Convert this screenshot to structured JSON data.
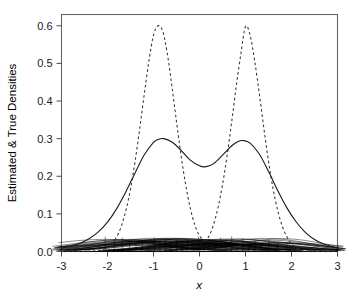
{
  "chart_data": {
    "type": "line",
    "title": "",
    "xlabel": "x",
    "ylabel": "Estimated & True Densities",
    "xlim": [
      -3,
      3
    ],
    "ylim": [
      0,
      0.63
    ],
    "grid": false,
    "legend": "none",
    "xticks": [
      "-3",
      "-2",
      "-1",
      "0",
      "1",
      "2",
      "3"
    ],
    "xtick_values": [
      -3,
      -2,
      -1,
      0,
      1,
      2,
      3
    ],
    "yticks": [
      "0.0",
      "0.1",
      "0.2",
      "0.3",
      "0.4",
      "0.5",
      "0.6"
    ],
    "ytick_values": [
      0.0,
      0.1,
      0.2,
      0.3,
      0.4,
      0.5,
      0.6
    ],
    "series": [
      {
        "name": "true density",
        "style": "dashed",
        "color": "#333333",
        "description": "Two narrow normal components centred at -1 and 1, each peaking near 0.60",
        "peaks": [
          {
            "x": -1.0,
            "y": 0.6
          },
          {
            "x": 1.0,
            "y": 0.6
          }
        ],
        "x": [
          -3.0,
          -2.8,
          -2.6,
          -2.4,
          -2.2,
          -2.0,
          -1.9,
          -1.8,
          -1.7,
          -1.6,
          -1.5,
          -1.4,
          -1.3,
          -1.2,
          -1.1,
          -1.0,
          -0.9,
          -0.8,
          -0.7,
          -0.6,
          -0.5,
          -0.4,
          -0.3,
          -0.2,
          -0.1,
          0.0,
          0.1,
          0.2,
          0.3,
          0.4,
          0.5,
          0.6,
          0.7,
          0.8,
          0.9,
          1.0,
          1.1,
          1.2,
          1.3,
          1.4,
          1.5,
          1.6,
          1.7,
          1.8,
          1.9,
          2.0,
          2.2,
          2.4,
          2.6,
          2.8,
          3.0
        ],
        "y": [
          0.0,
          0.0,
          0.0,
          0.001,
          0.003,
          0.011,
          0.021,
          0.039,
          0.067,
          0.109,
          0.166,
          0.24,
          0.327,
          0.419,
          0.506,
          0.575,
          0.6,
          0.586,
          0.526,
          0.44,
          0.345,
          0.255,
          0.177,
          0.115,
          0.07,
          0.042,
          0.03,
          0.039,
          0.07,
          0.115,
          0.177,
          0.255,
          0.345,
          0.44,
          0.526,
          0.598,
          0.575,
          0.506,
          0.419,
          0.327,
          0.24,
          0.166,
          0.109,
          0.067,
          0.039,
          0.021,
          0.003,
          0.001,
          0.0,
          0.0,
          0.0
        ]
      },
      {
        "name": "estimated density",
        "style": "solid",
        "color": "#1a1a1a",
        "description": "Oversmoothed kernel density estimate, bimodal with peaks near 0.30 and a valley near 0.225",
        "peaks": [
          {
            "x": -0.78,
            "y": 0.3
          },
          {
            "x": 0.95,
            "y": 0.295
          }
        ],
        "valley": {
          "x": 0.12,
          "y": 0.225
        },
        "x": [
          -3.0,
          -2.8,
          -2.6,
          -2.4,
          -2.2,
          -2.0,
          -1.8,
          -1.6,
          -1.4,
          -1.2,
          -1.0,
          -0.9,
          -0.78,
          -0.6,
          -0.4,
          -0.2,
          0.0,
          0.12,
          0.3,
          0.5,
          0.7,
          0.85,
          0.95,
          1.1,
          1.3,
          1.5,
          1.7,
          1.9,
          2.1,
          2.3,
          2.5,
          2.7,
          3.0
        ],
        "y": [
          0.009,
          0.014,
          0.022,
          0.034,
          0.052,
          0.078,
          0.114,
          0.159,
          0.209,
          0.257,
          0.29,
          0.298,
          0.3,
          0.291,
          0.269,
          0.243,
          0.228,
          0.225,
          0.233,
          0.256,
          0.281,
          0.293,
          0.295,
          0.288,
          0.259,
          0.213,
          0.162,
          0.116,
          0.079,
          0.051,
          0.032,
          0.02,
          0.009
        ]
      },
      {
        "name": "individual kernel components",
        "style": "solid-thin",
        "color": "#000000",
        "description": "Dense overlapping bundle of individual scaled kernels near the baseline, each peaking around 0.03, centred between about -2 and 2",
        "component_peak_height": 0.03,
        "component_count": 60,
        "centers": [
          -2.05,
          -1.92,
          -1.85,
          -1.74,
          -1.68,
          -1.6,
          -1.52,
          -1.45,
          -1.38,
          -1.3,
          -1.24,
          -1.17,
          -1.1,
          -1.04,
          -0.98,
          -0.92,
          -0.86,
          -0.8,
          -0.74,
          -0.68,
          -0.62,
          -0.56,
          -0.5,
          -0.44,
          -0.38,
          -0.32,
          -0.26,
          -0.2,
          -0.14,
          -0.08,
          -0.02,
          0.04,
          0.1,
          0.16,
          0.22,
          0.28,
          0.34,
          0.4,
          0.46,
          0.52,
          0.58,
          0.64,
          0.7,
          0.76,
          0.82,
          0.88,
          0.94,
          1.0,
          1.07,
          1.14,
          1.21,
          1.28,
          1.35,
          1.43,
          1.51,
          1.6,
          1.7,
          1.8,
          1.9,
          2.0
        ]
      }
    ]
  },
  "axes": {
    "y_title": "Estimated & True Densities",
    "x_title": "x"
  }
}
